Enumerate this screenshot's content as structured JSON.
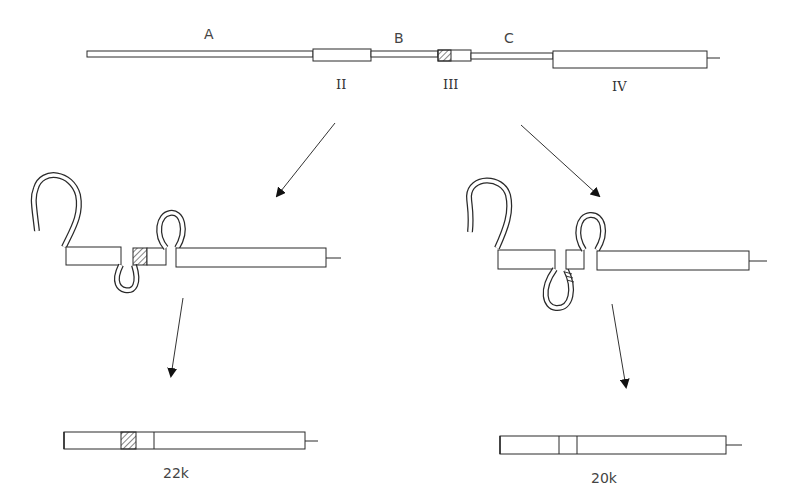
{
  "diagram": {
    "top_gene": {
      "segment_labels": [
        "A",
        "B",
        "C"
      ],
      "exon_labels": [
        "II",
        "III",
        "IV"
      ]
    },
    "left_product": {
      "label": "22k"
    },
    "right_product": {
      "label": "20k"
    },
    "colors": {
      "stroke": "#2a2a2a",
      "background": "#ffffff",
      "label": "#444444"
    }
  }
}
